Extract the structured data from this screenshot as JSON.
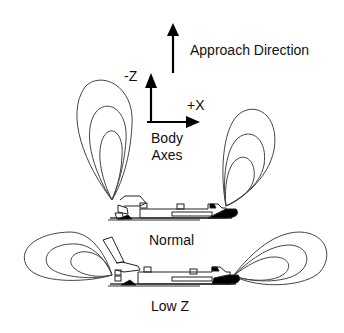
{
  "labels": {
    "approach_direction": "Approach Direction",
    "axis_minus_z": "-Z",
    "axis_plus_x": "+X",
    "body_axes_line1": "Body",
    "body_axes_line2": "Axes",
    "mode_normal": "Normal",
    "mode_low_z": "Low Z"
  },
  "icons": {
    "approach_arrow": "up-arrow",
    "minus_z_arrow": "up-arrow",
    "plus_x_arrow": "right-arrow",
    "upper_orbiter": "space-shuttle-orbiter",
    "lower_orbiter": "space-shuttle-orbiter"
  },
  "plumes": {
    "normal": {
      "orientation": "upward",
      "contours_per_side": 3
    },
    "low_z": {
      "orientation": "sideways",
      "contours_per_side": 3
    }
  },
  "colors": {
    "line": "#333333",
    "fill_black": "#000000",
    "background": "#ffffff"
  }
}
